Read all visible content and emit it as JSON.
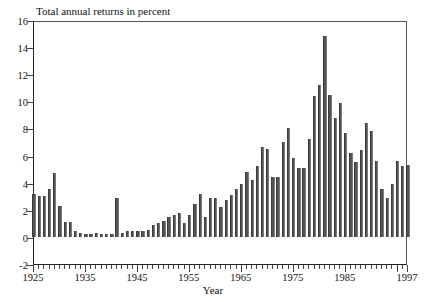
{
  "chart_data": {
    "type": "bar",
    "title": "Total annual returns in percent",
    "xlabel": "Year",
    "ylabel": "",
    "ylim": [
      -2,
      16
    ],
    "xlim": [
      1925,
      1997
    ],
    "grid": false,
    "legend": null,
    "ytick_labels": [
      "16",
      "14",
      "12",
      "10",
      "8",
      "6",
      "4",
      "2",
      "0",
      "-2"
    ],
    "ytick_values": [
      16,
      14,
      12,
      10,
      8,
      6,
      4,
      2,
      0,
      -2
    ],
    "xtick_labels": [
      "1925",
      "1935",
      "1945",
      "1955",
      "1965",
      "1975",
      "1985",
      "1997"
    ],
    "xtick_values": [
      1925,
      1935,
      1945,
      1955,
      1965,
      1975,
      1985,
      1997
    ],
    "bar_color": "#545454",
    "categories": [
      1925,
      1926,
      1927,
      1928,
      1929,
      1930,
      1931,
      1932,
      1933,
      1934,
      1935,
      1936,
      1937,
      1938,
      1939,
      1940,
      1941,
      1942,
      1943,
      1944,
      1945,
      1946,
      1947,
      1948,
      1949,
      1950,
      1951,
      1952,
      1953,
      1954,
      1955,
      1956,
      1957,
      1958,
      1959,
      1960,
      1961,
      1962,
      1963,
      1964,
      1965,
      1966,
      1967,
      1968,
      1969,
      1970,
      1971,
      1972,
      1973,
      1974,
      1975,
      1976,
      1977,
      1978,
      1979,
      1980,
      1981,
      1982,
      1983,
      1984,
      1985,
      1986,
      1987,
      1988,
      1989,
      1990,
      1991,
      1992,
      1993,
      1994,
      1995,
      1996,
      1997
    ],
    "values": [
      3.2,
      3.0,
      3.0,
      3.5,
      4.7,
      2.3,
      1.1,
      1.1,
      0.4,
      0.3,
      0.2,
      0.2,
      0.3,
      0.2,
      0.2,
      0.2,
      2.9,
      0.3,
      0.4,
      0.4,
      0.4,
      0.4,
      0.5,
      0.9,
      1.0,
      1.2,
      1.5,
      1.6,
      1.8,
      1.0,
      1.6,
      2.4,
      3.2,
      1.5,
      2.9,
      2.9,
      2.2,
      2.7,
      3.1,
      3.5,
      3.9,
      4.8,
      4.2,
      5.2,
      6.6,
      6.5,
      4.4,
      4.4,
      7.0,
      8.0,
      5.8,
      5.1,
      5.1,
      7.2,
      10.4,
      11.2,
      14.8,
      10.5,
      8.8,
      9.9,
      7.7,
      6.2,
      5.5,
      6.4,
      8.4,
      7.8,
      5.6,
      3.5,
      2.9,
      3.9,
      5.6,
      5.2,
      5.3
    ]
  },
  "axes": {
    "x_axis_title": "Year",
    "title_text": "Total annual returns in percent"
  }
}
